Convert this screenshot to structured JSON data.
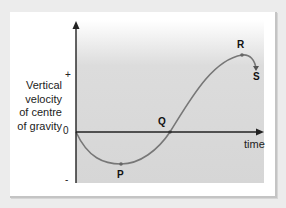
{
  "diagram": {
    "y_axis_label_lines": [
      "Vertical",
      "velocity",
      "of centre",
      "of gravity"
    ],
    "x_axis_label": "time",
    "ticks": {
      "plus": "+",
      "zero": "0",
      "minus": "-"
    },
    "points": {
      "P": "P",
      "Q": "Q",
      "R": "R",
      "S": "S"
    },
    "colors": {
      "background": "#ececec",
      "card": "#ffffff",
      "plot_top": "#ffffff",
      "plot_bottom": "#d6d6d6",
      "curve": "#777777",
      "axis": "#222222"
    }
  }
}
